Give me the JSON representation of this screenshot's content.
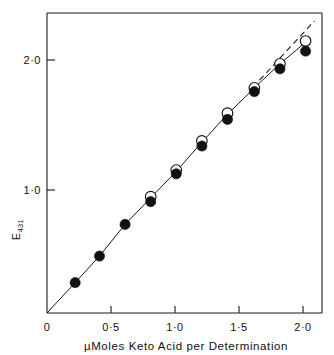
{
  "chart_data": {
    "type": "scatter",
    "title": "",
    "subtitle": "",
    "xlabel": "µMoles Keto Acid per Determination",
    "ylabel": "E431",
    "ylabel_base": "E",
    "ylabel_subscript": "431",
    "xlim": [
      0,
      2.15
    ],
    "ylim": [
      0,
      2.38
    ],
    "x_ticks": [
      0,
      0.5,
      1.0,
      1.5,
      2.0
    ],
    "x_tick_labels": [
      "0",
      "0·5",
      "1·0",
      "1·5",
      "2·0"
    ],
    "y_ticks": [
      1.0,
      2.0
    ],
    "y_tick_labels": [
      "1·0",
      "2·0"
    ],
    "grid": false,
    "legend": "none",
    "series": [
      {
        "name": "filled-circles",
        "marker": "filled circle",
        "color": "#111111",
        "x": [
          0.22,
          0.41,
          0.61,
          0.81,
          1.01,
          1.21,
          1.41,
          1.62,
          1.82,
          2.02
        ],
        "y": [
          0.24,
          0.45,
          0.7,
          0.88,
          1.1,
          1.32,
          1.53,
          1.75,
          1.93,
          2.07
        ]
      },
      {
        "name": "open-circles",
        "marker": "open circle",
        "color": "#111111",
        "x": [
          0.81,
          1.01,
          1.21,
          1.41,
          1.62,
          1.82,
          2.02
        ],
        "y": [
          0.92,
          1.13,
          1.36,
          1.58,
          1.78,
          1.97,
          2.15
        ]
      }
    ],
    "fit_line": {
      "name": "connecting-line",
      "style": "solid",
      "points": [
        [
          0.0,
          0.0
        ],
        [
          0.22,
          0.24
        ],
        [
          0.41,
          0.45
        ],
        [
          0.61,
          0.7
        ],
        [
          0.81,
          0.91
        ],
        [
          1.01,
          1.12
        ],
        [
          1.21,
          1.35
        ],
        [
          1.41,
          1.57
        ],
        [
          1.62,
          1.78
        ],
        [
          1.82,
          1.97
        ],
        [
          2.02,
          2.14
        ]
      ]
    },
    "extrapolation_line": {
      "name": "dashed-extrapolation",
      "style": "dashed",
      "points": [
        [
          1.66,
          1.84
        ],
        [
          2.09,
          2.31
        ]
      ]
    }
  }
}
